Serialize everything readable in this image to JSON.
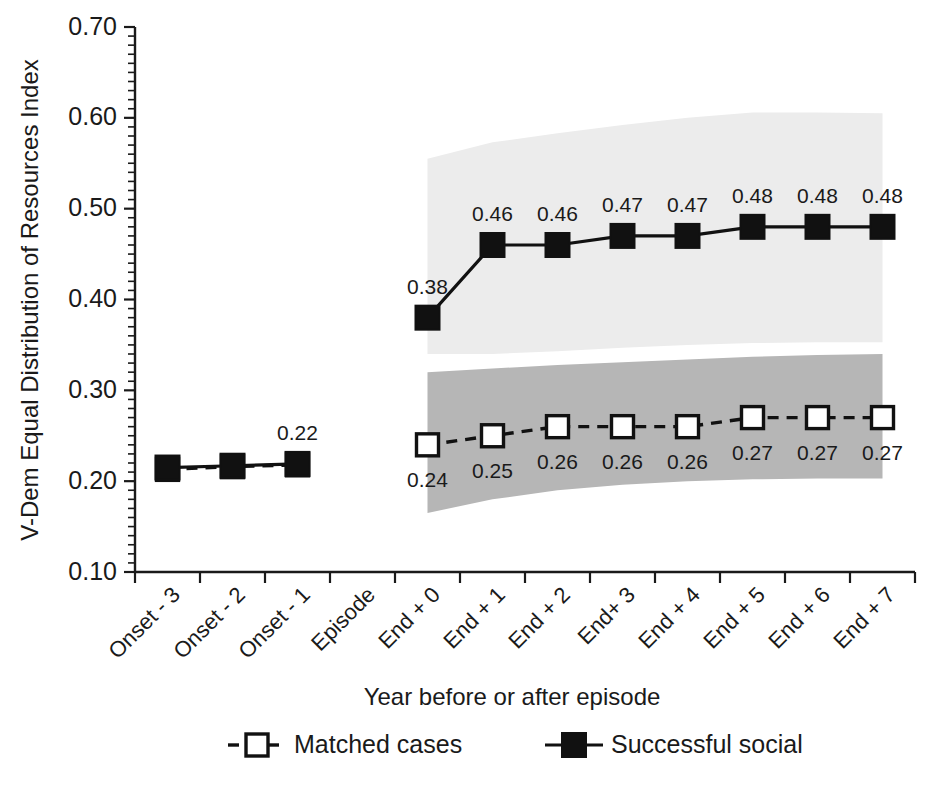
{
  "chart_data": {
    "type": "line",
    "title": "",
    "xlabel": "Year before or after episode",
    "ylabel": "V-Dem Equal Distribution of Resources Index",
    "ylim": [
      0.1,
      0.7
    ],
    "ytick_labels": [
      "0.10",
      "0.20",
      "0.30",
      "0.40",
      "0.50",
      "0.60",
      "0.70"
    ],
    "ytick_values": [
      0.1,
      0.2,
      0.3,
      0.4,
      0.5,
      0.6,
      0.7
    ],
    "minor_tick_step": 0.01,
    "grid": false,
    "legend_position": "below",
    "categories": [
      "Onset - 3",
      "Onset - 2",
      "Onset - 1",
      "Episode",
      "End + 0",
      "End + 1",
      "End + 2",
      "End+ 3",
      "End + 4",
      "End + 5",
      "End + 6",
      "End + 7"
    ],
    "series": [
      {
        "name": "Successful social",
        "marker": "filled-square",
        "line_style": "solid",
        "values": [
          0.215,
          0.217,
          0.219,
          null,
          0.38,
          0.46,
          0.46,
          0.47,
          0.47,
          0.48,
          0.48,
          0.48
        ],
        "point_labels": [
          "",
          "",
          "0.22",
          "",
          "0.38",
          "0.46",
          "0.46",
          "0.47",
          "0.47",
          "0.48",
          "0.48",
          "0.48"
        ],
        "band": {
          "name": "successful-social-confidence-band",
          "color": "#ececec",
          "upper": [
            null,
            null,
            null,
            null,
            0.555,
            0.573,
            0.583,
            0.592,
            0.6,
            0.606,
            0.606,
            0.605
          ],
          "lower": [
            null,
            null,
            null,
            null,
            0.34,
            0.34,
            0.343,
            0.347,
            0.35,
            0.352,
            0.353,
            0.353
          ]
        }
      },
      {
        "name": "Matched cases",
        "marker": "open-square",
        "line_style": "dashed",
        "values": [
          0.213,
          0.216,
          0.218,
          null,
          0.24,
          0.25,
          0.26,
          0.26,
          0.26,
          0.27,
          0.27,
          0.27
        ],
        "point_labels": [
          "",
          "",
          "",
          "",
          "0.24",
          "0.25",
          "0.26",
          "0.26",
          "0.26",
          "0.27",
          "0.27",
          "0.27"
        ],
        "band": {
          "name": "matched-cases-confidence-band",
          "color": "#b6b6b6",
          "upper": [
            null,
            null,
            null,
            null,
            0.32,
            0.324,
            0.328,
            0.331,
            0.334,
            0.337,
            0.339,
            0.34
          ],
          "lower": [
            null,
            null,
            null,
            null,
            0.165,
            0.18,
            0.19,
            0.196,
            0.2,
            0.202,
            0.203,
            0.203
          ]
        }
      }
    ],
    "shared_left_label": "0.22",
    "legend": [
      {
        "label": "Matched cases",
        "marker": "open-square",
        "line_style": "dashed"
      },
      {
        "label": "Successful social",
        "marker": "filled-square",
        "line_style": "solid"
      }
    ],
    "caption_partial": ""
  }
}
